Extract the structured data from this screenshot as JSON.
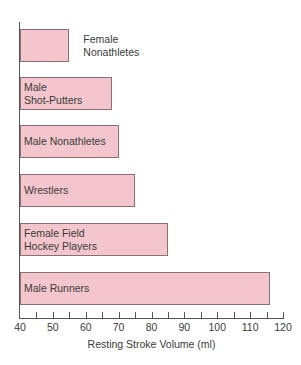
{
  "chart_data": {
    "type": "bar",
    "orientation": "horizontal",
    "title": "",
    "xlabel": "Resting Stroke Volume (ml)",
    "ylabel": "",
    "xlim": [
      40,
      120
    ],
    "grid": false,
    "legend": null,
    "categories": [
      "Female\nNonathletes",
      "Male\nShot-Putters",
      "Male Nonathletes",
      "Wrestlers",
      "Female Field\nHockey Players",
      "Male Runners"
    ],
    "values": [
      55,
      68,
      70,
      75,
      85,
      116
    ],
    "x_ticks": [
      40,
      50,
      60,
      70,
      80,
      90,
      100,
      110,
      120
    ],
    "minor_ticks": [
      45,
      55,
      65,
      75,
      85,
      95,
      105,
      115
    ],
    "colors": {
      "bar_fill": "#f2c6cc",
      "bar_border": "#8a7072",
      "axis": "#555555",
      "text": "#3a3a3a"
    }
  },
  "labels": {
    "bar0": "Female\nNonathletes",
    "bar1": "Male\nShot-Putters",
    "bar2": "Male Nonathletes",
    "bar3": "Wrestlers",
    "bar4": "Female Field\nHockey Players",
    "bar5": "Male Runners",
    "xlabel": "Resting Stroke Volume (ml)",
    "ticks": [
      "40",
      "50",
      "60",
      "70",
      "80",
      "90",
      "100",
      "110",
      "120"
    ]
  }
}
